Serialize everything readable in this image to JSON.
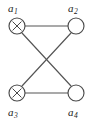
{
  "figure": {
    "width": 93,
    "height": 120,
    "background_color": "#ffffff",
    "edge_color": "#555555",
    "node_stroke_color": "#4a4a4a",
    "node_fill_color": "#ffffff",
    "label_color": "#1a1a1a"
  },
  "nodes": [
    {
      "id": "a1",
      "label_base": "a",
      "label_sub": "1",
      "label_text": "a1",
      "marker": "cross-in-circle",
      "marked": true,
      "cx": 17,
      "cy": 26,
      "r": 8,
      "label_x": 8,
      "label_y": 12
    },
    {
      "id": "a2",
      "label_base": "a",
      "label_sub": "2",
      "label_text": "a2",
      "marker": "empty-circle",
      "marked": false,
      "cx": 76,
      "cy": 26,
      "r": 8,
      "label_x": 68,
      "label_y": 12
    },
    {
      "id": "a3",
      "label_base": "a",
      "label_sub": "3",
      "label_text": "a3",
      "marker": "cross-in-circle",
      "marked": true,
      "cx": 17,
      "cy": 93,
      "r": 8,
      "label_x": 8,
      "label_y": 116
    },
    {
      "id": "a4",
      "label_base": "a",
      "label_sub": "4",
      "label_text": "a4",
      "marker": "empty-circle",
      "marked": false,
      "cx": 76,
      "cy": 93,
      "r": 8,
      "label_x": 68,
      "label_y": 116
    }
  ],
  "edges": [
    {
      "id": "edge-a1-a2",
      "from": "a1",
      "to": "a2",
      "kind": "horizontal-top",
      "x1": 25,
      "y1": 26,
      "x2": 68,
      "y2": 26
    },
    {
      "id": "edge-a3-a4",
      "from": "a3",
      "to": "a4",
      "kind": "horizontal-bottom",
      "x1": 25,
      "y1": 93,
      "x2": 68,
      "y2": 93
    },
    {
      "id": "edge-a1-a4",
      "from": "a1",
      "to": "a4",
      "kind": "diagonal",
      "x1": 22,
      "y1": 33,
      "x2": 71,
      "y2": 86
    },
    {
      "id": "edge-a3-a2",
      "from": "a3",
      "to": "a2",
      "kind": "diagonal",
      "x1": 22,
      "y1": 86,
      "x2": 71,
      "y2": 33
    }
  ]
}
